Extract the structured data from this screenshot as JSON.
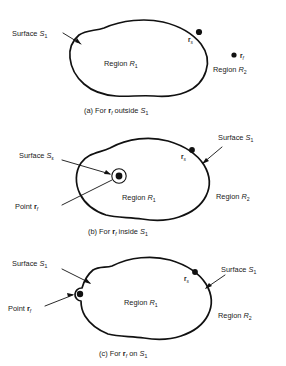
{
  "figure": {
    "type": "technical-diagram",
    "panel_count": 3,
    "background_color": "#ffffff",
    "ink_color": "#111111"
  },
  "symbols": {
    "surface_outer": "S",
    "surface_outer_sub": "1",
    "surface_epsilon": "S",
    "surface_epsilon_sub": "ε",
    "region_inner": "R",
    "region_inner_sub": "1",
    "region_outer": "R",
    "region_outer_sub": "2",
    "point_source": "r",
    "point_source_sub": "s",
    "point_field": "r",
    "point_field_sub": "f",
    "label_surface": "Surface",
    "label_region": "Region",
    "label_point": "Point"
  },
  "panels": [
    {
      "id": "panel-a",
      "tag": "(a)",
      "caption_prefix": "(a)",
      "caption_text": "For",
      "caption_mid": "outside",
      "caption_point": "r",
      "caption_point_sub": "f",
      "caption_surface": "S",
      "caption_surface_sub": "1",
      "caption_full": "(a)  For r_f outside S_1",
      "labels": {
        "surface": "Surface",
        "surface_sym": "S",
        "surface_sub": "1",
        "region_inner": "Region",
        "region_inner_sym": "R",
        "region_inner_sub": "1",
        "region_outer": "Region",
        "region_outer_sym": "R",
        "region_outer_sub": "2",
        "source_point_sym": "r",
        "source_point_sub": "s",
        "field_point_sym": "r",
        "field_point_sub": "f"
      },
      "field_point_position": "outside",
      "has_epsilon_circle": false
    },
    {
      "id": "panel-b",
      "tag": "(b)",
      "caption_prefix": "(b)",
      "caption_text": "For",
      "caption_mid": "inside",
      "caption_point": "r",
      "caption_point_sub": "f",
      "caption_surface": "S",
      "caption_surface_sub": "1",
      "caption_full": "(b)  For r_f inside S_1",
      "labels": {
        "surface_eps": "Surface",
        "surface_eps_sym": "S",
        "surface_eps_sub": "ε",
        "surface": "Surface",
        "surface_sym": "S",
        "surface_sub": "1",
        "region_inner": "Region",
        "region_inner_sym": "R",
        "region_inner_sub": "1",
        "region_outer": "Region",
        "region_outer_sym": "R",
        "region_outer_sub": "2",
        "point_label": "Point",
        "point_sym": "r",
        "point_sub": "f",
        "source_point_sym": "r",
        "source_point_sub": "s"
      },
      "field_point_position": "inside",
      "has_epsilon_circle": true
    },
    {
      "id": "panel-c",
      "tag": "(c)",
      "caption_prefix": "(c)",
      "caption_text": "For",
      "caption_mid": "on",
      "caption_point": "r",
      "caption_point_sub": "f",
      "caption_surface": "S",
      "caption_surface_sub": "1",
      "caption_full": "(c)  For r_f on S_1",
      "labels": {
        "surface_left": "Surface",
        "surface_left_sym": "S",
        "surface_left_sub": "1",
        "surface_right": "Surface",
        "surface_right_sym": "S",
        "surface_right_sub": "1",
        "region_inner": "Region",
        "region_inner_sym": "R",
        "region_inner_sub": "1",
        "region_outer": "Region",
        "region_outer_sym": "R",
        "region_outer_sub": "2",
        "point_label": "Point",
        "point_sym": "r",
        "point_sub": "f",
        "source_point_sym": "r",
        "source_point_sub": "s"
      },
      "field_point_position": "on-surface",
      "has_epsilon_circle": true
    }
  ]
}
